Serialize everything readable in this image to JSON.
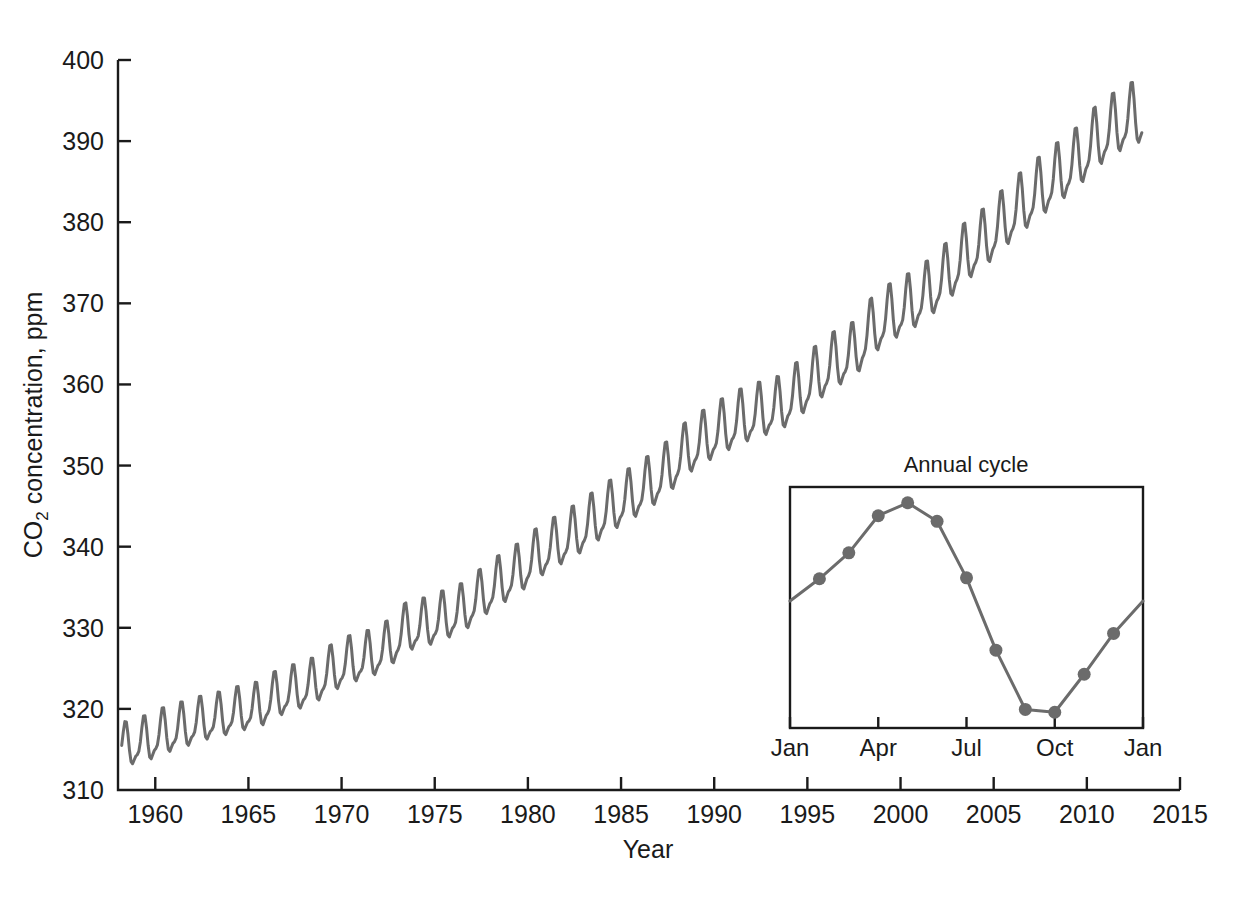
{
  "figure": {
    "background_color": "#ffffff",
    "line_color": "#6b6b6b",
    "axis_color": "#1a1a1a",
    "marker_color": "#6b6b6b"
  },
  "chart_data": [
    {
      "id": "main",
      "type": "line",
      "title": "",
      "xlabel": "Year",
      "ylabel": "CO2 concentration, ppm",
      "ylabel_display": "CO₂ concentration, ppm",
      "xlim": [
        1958,
        2015
      ],
      "ylim": [
        310,
        400
      ],
      "grid": false,
      "legend": "none",
      "xticks": [
        1960,
        1965,
        1970,
        1975,
        1980,
        1985,
        1990,
        1995,
        2000,
        2005,
        2010,
        2015
      ],
      "xtick_labels": [
        "1960",
        "1965",
        "1970",
        "1975",
        "1980",
        "1985",
        "1990",
        "1995",
        "2000",
        "2005",
        "2010",
        "2015"
      ],
      "yticks": [
        310,
        320,
        330,
        340,
        350,
        360,
        370,
        380,
        390,
        400
      ],
      "ytick_labels": [
        "310",
        "320",
        "330",
        "340",
        "350",
        "360",
        "370",
        "380",
        "390",
        "400"
      ],
      "description": "Monthly mean atmospheric CO2 at Mauna Loa: rising trend with annual sawtooth cycle",
      "series": [
        {
          "name": "CO2 monthly mean",
          "color": "#6b6b6b",
          "annual_trend": [
            {
              "year": 1958.5,
              "mean": 315.3,
              "amp": 3.0
            },
            {
              "year": 1959.5,
              "mean": 315.9,
              "amp": 3.2
            },
            {
              "year": 1960.5,
              "mean": 316.9,
              "amp": 3.2
            },
            {
              "year": 1961.5,
              "mean": 317.6,
              "amp": 3.2
            },
            {
              "year": 1962.5,
              "mean": 318.4,
              "amp": 3.1
            },
            {
              "year": 1963.5,
              "mean": 318.9,
              "amp": 3.1
            },
            {
              "year": 1964.5,
              "mean": 319.6,
              "amp": 3.1
            },
            {
              "year": 1965.5,
              "mean": 320.0,
              "amp": 3.2
            },
            {
              "year": 1966.5,
              "mean": 321.4,
              "amp": 3.2
            },
            {
              "year": 1967.5,
              "mean": 322.2,
              "amp": 3.2
            },
            {
              "year": 1968.5,
              "mean": 323.0,
              "amp": 3.2
            },
            {
              "year": 1969.5,
              "mean": 324.6,
              "amp": 3.3
            },
            {
              "year": 1970.5,
              "mean": 325.7,
              "amp": 3.3
            },
            {
              "year": 1971.5,
              "mean": 326.3,
              "amp": 3.3
            },
            {
              "year": 1972.5,
              "mean": 327.5,
              "amp": 3.3
            },
            {
              "year": 1973.5,
              "mean": 329.7,
              "amp": 3.4
            },
            {
              "year": 1974.5,
              "mean": 330.2,
              "amp": 3.4
            },
            {
              "year": 1975.5,
              "mean": 331.1,
              "amp": 3.4
            },
            {
              "year": 1976.5,
              "mean": 332.0,
              "amp": 3.4
            },
            {
              "year": 1977.5,
              "mean": 333.8,
              "amp": 3.4
            },
            {
              "year": 1978.5,
              "mean": 335.4,
              "amp": 3.5
            },
            {
              "year": 1979.5,
              "mean": 336.8,
              "amp": 3.5
            },
            {
              "year": 1980.5,
              "mean": 338.7,
              "amp": 3.5
            },
            {
              "year": 1981.5,
              "mean": 340.1,
              "amp": 3.5
            },
            {
              "year": 1982.5,
              "mean": 341.4,
              "amp": 3.6
            },
            {
              "year": 1983.5,
              "mean": 343.0,
              "amp": 3.6
            },
            {
              "year": 1984.5,
              "mean": 344.6,
              "amp": 3.6
            },
            {
              "year": 1985.5,
              "mean": 346.0,
              "amp": 3.6
            },
            {
              "year": 1986.5,
              "mean": 347.4,
              "amp": 3.7
            },
            {
              "year": 1987.5,
              "mean": 349.2,
              "amp": 3.7
            },
            {
              "year": 1988.5,
              "mean": 351.6,
              "amp": 3.7
            },
            {
              "year": 1989.5,
              "mean": 353.1,
              "amp": 3.7
            },
            {
              "year": 1990.5,
              "mean": 354.4,
              "amp": 3.8
            },
            {
              "year": 1991.5,
              "mean": 355.6,
              "amp": 3.8
            },
            {
              "year": 1992.5,
              "mean": 356.4,
              "amp": 3.8
            },
            {
              "year": 1993.5,
              "mean": 357.1,
              "amp": 3.8
            },
            {
              "year": 1994.5,
              "mean": 358.8,
              "amp": 3.9
            },
            {
              "year": 1995.5,
              "mean": 360.8,
              "amp": 3.9
            },
            {
              "year": 1996.5,
              "mean": 362.6,
              "amp": 3.9
            },
            {
              "year": 1997.5,
              "mean": 363.7,
              "amp": 3.9
            },
            {
              "year": 1998.5,
              "mean": 366.7,
              "amp": 4.0
            },
            {
              "year": 1999.5,
              "mean": 368.4,
              "amp": 4.0
            },
            {
              "year": 2000.5,
              "mean": 369.6,
              "amp": 4.0
            },
            {
              "year": 2001.5,
              "mean": 371.2,
              "amp": 4.0
            },
            {
              "year": 2002.5,
              "mean": 373.3,
              "amp": 4.1
            },
            {
              "year": 2003.5,
              "mean": 375.8,
              "amp": 4.1
            },
            {
              "year": 2004.5,
              "mean": 377.5,
              "amp": 4.1
            },
            {
              "year": 2005.5,
              "mean": 379.8,
              "amp": 4.1
            },
            {
              "year": 2006.5,
              "mean": 381.9,
              "amp": 4.2
            },
            {
              "year": 2007.5,
              "mean": 383.8,
              "amp": 4.2
            },
            {
              "year": 2008.5,
              "mean": 385.6,
              "amp": 4.2
            },
            {
              "year": 2009.5,
              "mean": 387.4,
              "amp": 4.2
            },
            {
              "year": 2010.5,
              "mean": 389.9,
              "amp": 4.3
            },
            {
              "year": 2011.5,
              "mean": 391.6,
              "amp": 4.3
            },
            {
              "year": 2012.6,
              "mean": 393.0,
              "amp": 4.3
            }
          ],
          "first_value": 317.0,
          "first_minimum": 312.6,
          "last_peak": 392.6,
          "last_value": 390.0
        }
      ]
    },
    {
      "id": "inset",
      "type": "line",
      "title": "Annual cycle",
      "xlabel": "",
      "ylabel": "",
      "grid": false,
      "legend": "none",
      "markers": true,
      "xtick_labels": [
        "Jan",
        "Apr",
        "Jul",
        "Oct",
        "Jan"
      ],
      "xticks": [
        0,
        3,
        6,
        9,
        12
      ],
      "xlim": [
        0,
        12
      ],
      "ylim": [
        318.5,
        344.5
      ],
      "categories": [
        "Jan",
        "Feb",
        "Mar",
        "Apr",
        "May",
        "Jun",
        "Jul",
        "Aug",
        "Sep",
        "Oct",
        "Nov",
        "Dec",
        "Jan"
      ],
      "values": [
        332.2,
        334.6,
        337.4,
        341.4,
        342.8,
        340.8,
        334.7,
        326.9,
        320.5,
        320.2,
        324.3,
        328.7,
        332.2
      ],
      "marker_points": [
        {
          "month": "Feb",
          "x": 1,
          "y": 334.6
        },
        {
          "month": "Mar",
          "x": 2,
          "y": 337.4
        },
        {
          "month": "Apr",
          "x": 3,
          "y": 341.4
        },
        {
          "month": "May",
          "x": 4,
          "y": 342.8
        },
        {
          "month": "Jun",
          "x": 5,
          "y": 340.8
        },
        {
          "month": "Jul",
          "x": 6,
          "y": 334.7
        },
        {
          "month": "Aug",
          "x": 7,
          "y": 326.9
        },
        {
          "month": "Sep",
          "x": 8,
          "y": 320.5
        },
        {
          "month": "Oct",
          "x": 9,
          "y": 320.2
        },
        {
          "month": "Nov",
          "x": 10,
          "y": 324.3
        },
        {
          "month": "Dec",
          "x": 11,
          "y": 328.7
        }
      ]
    }
  ]
}
